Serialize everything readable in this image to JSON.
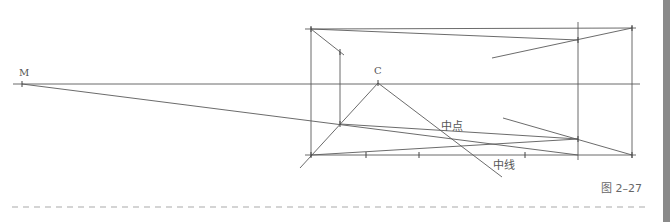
{
  "figure": {
    "caption": "图 2–27",
    "colors": {
      "line": "#5a5a5a",
      "dash": "#aaaaaa",
      "side_bar": "#8a8a8a"
    }
  },
  "labels": {
    "M": "M",
    "C": "C",
    "midpoint": "中点",
    "midline": "中线"
  },
  "points": {
    "M": [
      22,
      84
    ],
    "C": [
      378,
      83
    ],
    "rect_top_left": [
      311,
      29
    ],
    "rect_top_right": [
      632,
      28
    ],
    "rect_bottom_left": [
      311,
      155
    ],
    "rect_bottom_right": [
      632,
      155
    ],
    "inner_top": [
      340,
      52
    ],
    "inner_bottom": [
      340,
      124
    ],
    "right_inner_top": [
      578,
      40
    ],
    "right_inner_bottom": [
      578,
      139
    ]
  },
  "lines": [
    {
      "name": "horizon-line",
      "x1": 13,
      "y1": 84,
      "x2": 640,
      "y2": 84
    },
    {
      "name": "rect-top-edge",
      "x1": 305,
      "y1": 29,
      "x2": 636,
      "y2": 28
    },
    {
      "name": "rect-bottom-edge",
      "x1": 305,
      "y1": 155,
      "x2": 636,
      "y2": 155
    },
    {
      "name": "rect-left-edge",
      "x1": 311,
      "y1": 27,
      "x2": 311,
      "y2": 157
    },
    {
      "name": "rect-right-edge",
      "x1": 632,
      "y1": 26,
      "x2": 632,
      "y2": 158
    },
    {
      "name": "right-vertical",
      "x1": 578,
      "y1": 22,
      "x2": 578,
      "y2": 160
    },
    {
      "name": "inner-vertical",
      "x1": 340,
      "y1": 52,
      "x2": 340,
      "y2": 124
    },
    {
      "name": "diag-top-left",
      "x1": 311,
      "y1": 29,
      "x2": 344,
      "y2": 55
    },
    {
      "name": "top-converge",
      "x1": 311,
      "y1": 29,
      "x2": 578,
      "y2": 40
    },
    {
      "name": "right-top-diag",
      "x1": 492,
      "y1": 58,
      "x2": 632,
      "y2": 28
    },
    {
      "name": "M-line",
      "x1": 22,
      "y1": 84,
      "x2": 578,
      "y2": 155
    },
    {
      "name": "inner-bottom-line",
      "x1": 340,
      "y1": 124,
      "x2": 578,
      "y2": 139
    },
    {
      "name": "bottom-left-line",
      "x1": 311,
      "y1": 155,
      "x2": 578,
      "y2": 139
    },
    {
      "name": "right-lower-diag",
      "x1": 503,
      "y1": 118,
      "x2": 632,
      "y2": 155
    },
    {
      "name": "C-left-diag",
      "x1": 378,
      "y1": 83,
      "x2": 300,
      "y2": 168
    },
    {
      "name": "C-right-diag-midline",
      "x1": 378,
      "y1": 83,
      "x2": 502,
      "y2": 177
    }
  ],
  "ticks": [
    [
      22,
      84
    ],
    [
      378,
      83
    ],
    [
      311,
      29
    ],
    [
      632,
      28
    ],
    [
      311,
      155
    ],
    [
      632,
      155
    ],
    [
      340,
      52
    ],
    [
      340,
      124
    ],
    [
      578,
      40
    ],
    [
      578,
      139
    ],
    [
      366,
      155
    ],
    [
      419,
      155
    ],
    [
      525,
      155
    ]
  ],
  "dashed_rule": {
    "x1": 12,
    "y1": 207,
    "x2": 645,
    "y2": 207
  }
}
